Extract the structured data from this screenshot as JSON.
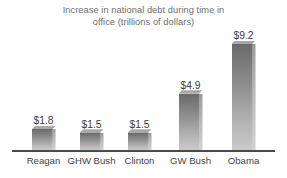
{
  "chart_data": {
    "type": "bar",
    "title": "Increase in national debt during time in\noffice (trillions of dollars)",
    "xlabel": "",
    "ylabel": "",
    "ylim": [
      0,
      9.2
    ],
    "grid": false,
    "legend": false,
    "units": "trillions of dollars",
    "categories": [
      "Reagan",
      "GHW Bush",
      "Clinton",
      "GW Bush",
      "Obama"
    ],
    "values": [
      1.8,
      1.5,
      1.5,
      4.9,
      9.2
    ],
    "value_labels": [
      "$1.8",
      "$1.5",
      "$1.5",
      "$4.9",
      "$9.2"
    ],
    "bars": [
      {
        "category": "Reagan",
        "value": 1.8,
        "label": "$1.8"
      },
      {
        "category": "GHW Bush",
        "value": 1.5,
        "label": "$1.5"
      },
      {
        "category": "Clinton",
        "value": 1.5,
        "label": "$1.5"
      },
      {
        "category": "GW Bush",
        "value": 4.9,
        "label": "$4.9"
      },
      {
        "category": "Obama",
        "value": 9.2,
        "label": "$9.2"
      }
    ]
  },
  "style": {
    "background": "#ffffff",
    "title_color": "#6e6e6e",
    "axis_line_color": "#4a4a4a",
    "category_label_color": "#3f3f3f",
    "value_label_color": "#3c3c3c",
    "bar_face_top_color": "#6a6a6a",
    "bar_face_bottom_color": "#cacaca",
    "bar_side_color": "#b6b6b6",
    "bar_top_color": "#a8a8a8"
  }
}
